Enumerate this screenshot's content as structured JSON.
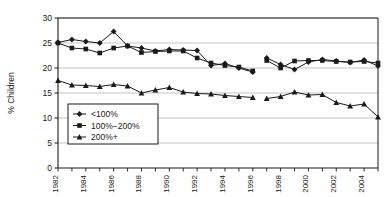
{
  "chart_data": {
    "type": "line",
    "title": "",
    "xlabel": "",
    "ylabel": "% Children",
    "ylim": [
      0,
      30
    ],
    "xlim": [
      1982,
      2005
    ],
    "ytick_labels": [
      "0",
      "5",
      "10",
      "15",
      "20",
      "25",
      "30"
    ],
    "ytick_values": [
      0,
      5,
      10,
      15,
      20,
      25,
      30
    ],
    "xtick_labels": [
      "1982",
      "1984",
      "1986",
      "1988",
      "1990",
      "1992",
      "1994",
      "1996",
      "1998",
      "2000",
      "2002",
      "2004"
    ],
    "xtick_values": [
      1982,
      1984,
      1986,
      1988,
      1990,
      1992,
      1994,
      1996,
      1998,
      2000,
      2002,
      2004
    ],
    "minor_xticks": [
      1982,
      1983,
      1984,
      1985,
      1986,
      1987,
      1988,
      1989,
      1990,
      1991,
      1992,
      1993,
      1994,
      1995,
      1996,
      1997,
      1998,
      1999,
      2000,
      2001,
      2002,
      2003,
      2004,
      2005
    ],
    "grid": "horizontal",
    "legend_position": "lower-left-inside",
    "line_color": "#1a1a1a",
    "grid_color": "#b4b4b4",
    "axis_color": "#1a1a1a",
    "series": [
      {
        "name": "<100%",
        "marker": "diamond",
        "segments": [
          {
            "x": [
              1982,
              1983,
              1984,
              1985,
              1986,
              1987,
              1988,
              1989,
              1990,
              1991,
              1992,
              1993,
              1994,
              1995,
              1996
            ],
            "values": [
              25.1,
              25.7,
              25.3,
              25.0,
              27.3,
              24.4,
              24.0,
              23.4,
              23.7,
              23.6,
              23.5,
              20.5,
              20.9,
              20.0,
              19.2
            ]
          },
          {
            "x": [
              1997,
              1998,
              1999,
              2000,
              2001,
              2002,
              2003,
              2004,
              2005
            ],
            "values": [
              22.0,
              20.7,
              19.7,
              21.2,
              21.7,
              21.4,
              21.1,
              21.6,
              20.4
            ]
          }
        ]
      },
      {
        "name": "100%−200%",
        "marker": "square",
        "segments": [
          {
            "x": [
              1982,
              1983,
              1984,
              1985,
              1986,
              1987,
              1988,
              1989,
              1990,
              1991,
              1992,
              1993,
              1994,
              1995,
              1996
            ],
            "values": [
              25.0,
              24.0,
              23.8,
              23.0,
              24.0,
              24.4,
              23.1,
              23.3,
              23.4,
              23.4,
              22.0,
              21.0,
              20.5,
              20.2,
              19.4
            ]
          },
          {
            "x": [
              1997,
              1998,
              1999,
              2000,
              2001,
              2002,
              2003,
              2004,
              2005
            ],
            "values": [
              21.5,
              20.0,
              21.4,
              21.5,
              21.5,
              21.3,
              21.2,
              21.3,
              21.0
            ]
          }
        ]
      },
      {
        "name": "200%+",
        "marker": "triangle",
        "segments": [
          {
            "x": [
              1982,
              1983,
              1984,
              1985,
              1986,
              1987,
              1988,
              1989,
              1990,
              1991,
              1992,
              1993,
              1994,
              1995,
              1996
            ],
            "values": [
              17.5,
              16.6,
              16.5,
              16.3,
              16.7,
              16.4,
              15.0,
              15.6,
              16.1,
              15.2,
              14.9,
              14.8,
              14.5,
              14.3,
              14.1
            ]
          },
          {
            "x": [
              1997,
              1998,
              1999,
              2000,
              2001,
              2002,
              2003,
              2004,
              2005
            ],
            "values": [
              13.9,
              14.3,
              15.2,
              14.6,
              14.7,
              13.1,
              12.4,
              12.8,
              10.2
            ]
          }
        ]
      }
    ],
    "legend_entries": [
      {
        "label": "<100%",
        "marker": "diamond"
      },
      {
        "label": "100%−200%",
        "marker": "square"
      },
      {
        "label": "200%+",
        "marker": "triangle"
      }
    ]
  }
}
